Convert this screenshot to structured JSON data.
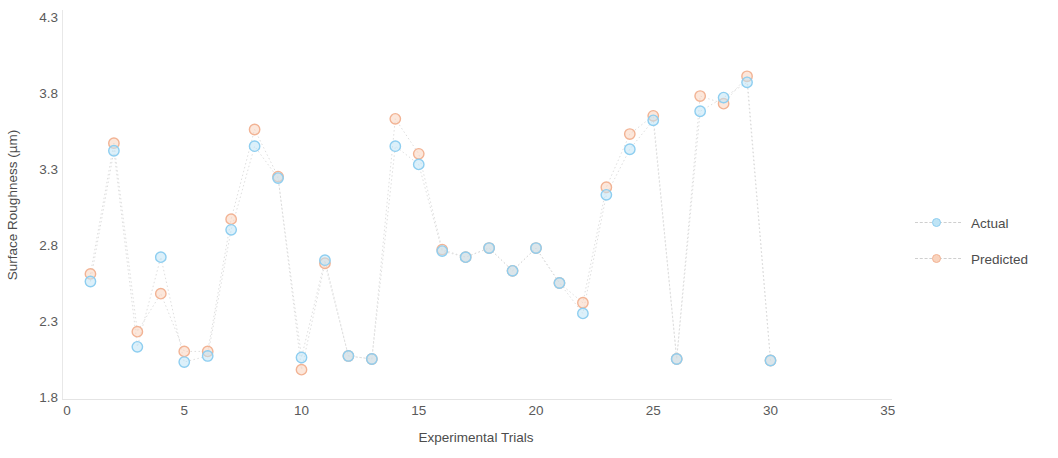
{
  "chart_data": {
    "type": "scatter",
    "title": "",
    "xlabel": "Experimental Trials",
    "ylabel": "Surface Roughness (µm)",
    "xlim": [
      0,
      38
    ],
    "ylim": [
      1.8,
      4.3
    ],
    "xticks": [
      0,
      5,
      10,
      15,
      20,
      25,
      30,
      35
    ],
    "yticks": [
      1.8,
      2.3,
      2.8,
      3.3,
      3.8,
      4.3
    ],
    "xtick_labels": [
      "0",
      "5",
      "10",
      "15",
      "20",
      "25",
      "30",
      "35"
    ],
    "ytick_labels": [
      "1.8",
      "2.3",
      "2.8",
      "3.3",
      "3.8",
      "4.3"
    ],
    "grid": false,
    "legend_position": "right",
    "x": [
      1,
      2,
      3,
      4,
      5,
      6,
      7,
      8,
      9,
      10,
      11,
      12,
      13,
      14,
      15,
      16,
      17,
      18,
      19,
      20,
      21,
      22,
      23,
      24,
      25,
      26,
      27,
      28,
      29,
      30
    ],
    "series": [
      {
        "name": "Actual",
        "color": "#8ecef0",
        "fill": "#bfe4f5",
        "marker": "circle",
        "linestyle": "dotted",
        "values": [
          2.56,
          3.42,
          2.13,
          2.72,
          2.03,
          2.07,
          2.9,
          3.45,
          3.24,
          2.06,
          2.7,
          2.07,
          2.05,
          3.45,
          3.33,
          2.76,
          2.72,
          2.78,
          2.63,
          2.78,
          2.55,
          2.35,
          3.13,
          3.43,
          3.62,
          2.05,
          3.68,
          3.77,
          3.87,
          2.04
        ]
      },
      {
        "name": "Predicted",
        "color": "#f2b394",
        "fill": "#f9d3bd",
        "marker": "circle",
        "linestyle": "dotted",
        "values": [
          2.61,
          3.47,
          2.23,
          2.48,
          2.1,
          2.1,
          2.97,
          3.56,
          3.25,
          1.98,
          2.68,
          2.07,
          2.05,
          3.63,
          3.4,
          2.77,
          2.72,
          2.78,
          2.63,
          2.78,
          2.55,
          2.42,
          3.18,
          3.53,
          3.65,
          2.05,
          3.78,
          3.73,
          3.91,
          2.04
        ]
      }
    ]
  },
  "legend": {
    "items": [
      {
        "label": "Actual",
        "color": "#8ecef0",
        "fill": "#bfe4f5"
      },
      {
        "label": "Predicted",
        "color": "#f2b394",
        "fill": "#f9d3bd"
      }
    ]
  },
  "axes": {
    "y_title": "Surface Roughness (µm)",
    "x_title": "Experimental Trials"
  },
  "colors": {
    "actual_stroke": "#8ecef0",
    "actual_fill": "#bfe4f5",
    "predicted_stroke": "#f2b394",
    "predicted_fill": "#f9d3bd",
    "axis": "#e4e4e4",
    "text": "#5a5a5a",
    "connector": "#d8d8d8"
  }
}
